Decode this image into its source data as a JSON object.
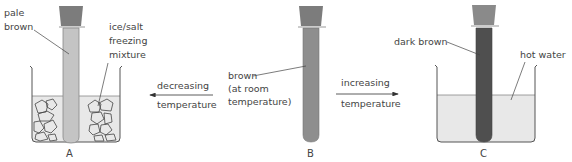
{
  "colors": {
    "pale_brown": "#c2c2c2",
    "brown": "#8e8e8e",
    "dark_brown": "#4f4f4f",
    "stopper": "#7a7a7a",
    "liquid": "#e6e6e6",
    "outline": "#555555",
    "text": "#444444"
  },
  "setup_a": {
    "caption": "A",
    "tube_label_line1": "pale",
    "tube_label_line2": "brown",
    "bath_label_line1": "ice/salt",
    "bath_label_line2": "freezing",
    "bath_label_line3": "mixture"
  },
  "setup_b": {
    "caption": "B",
    "label_line1": "brown",
    "label_line2": "(at room",
    "label_line3": "temperature)"
  },
  "setup_c": {
    "caption": "C",
    "tube_label": "dark brown",
    "bath_label": "hot water"
  },
  "arrow_left": {
    "line1": "decreasing",
    "line2": "temperature"
  },
  "arrow_right": {
    "line1": "increasing",
    "line2": "temperature"
  }
}
